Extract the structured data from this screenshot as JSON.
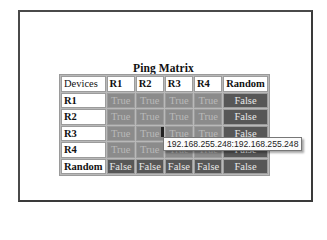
{
  "title": "Ping Matrix",
  "colors": {
    "true_cell": "#8b8b8b",
    "false_cell": "#575757",
    "header_cell": "#ffffff"
  },
  "table": {
    "corner_label": "Devices",
    "columns": [
      "R1",
      "R2",
      "R3",
      "R4",
      "Random"
    ],
    "rows": [
      {
        "label": "R1",
        "cells": [
          "True",
          "True",
          "True",
          "True",
          "False"
        ]
      },
      {
        "label": "R2",
        "cells": [
          "True",
          "True",
          "True",
          "True",
          "False"
        ]
      },
      {
        "label": "R3",
        "cells": [
          "True",
          "True",
          "True",
          "True",
          "False"
        ]
      },
      {
        "label": "R4",
        "cells": [
          "True",
          "True",
          "True",
          "True",
          "False"
        ]
      },
      {
        "label": "Random",
        "cells": [
          "False",
          "False",
          "False",
          "False",
          "False"
        ]
      }
    ]
  },
  "tooltip": {
    "text": "192.168.255.248:192.168.255.248"
  }
}
